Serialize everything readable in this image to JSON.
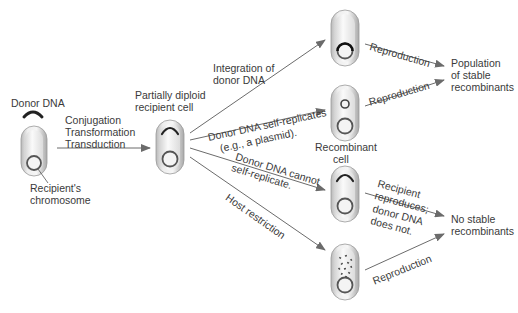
{
  "diagram": {
    "donor": {
      "label": "Donor DNA",
      "chromosome_label_1": "Recipient's",
      "chromosome_label_2": "chromosome"
    },
    "transfer": {
      "line1": "Conjugation",
      "line2": "Transformation",
      "line3": "Transduction"
    },
    "partial_diploid": {
      "line1": "Partially diploid",
      "line2": "recipient cell"
    },
    "paths": [
      {
        "label_1": "Integration of",
        "label_2": "donor DNA",
        "outcome_arrow": "Reproduction"
      },
      {
        "label_1": "Donor DNA self-replicates",
        "label_2": "(e.g., a plasmid).",
        "outcome_arrow": "Reproduction"
      },
      {
        "label_1": "Donor DNA cannot",
        "label_2": "self-replicate.",
        "outcome_arrow_1": "Recipient",
        "outcome_arrow_2": "reproduces;",
        "outcome_arrow_3": "donor DNA",
        "outcome_arrow_4": "does not."
      },
      {
        "label_1": "Host restriction",
        "outcome_arrow": "Reproduction"
      }
    ],
    "recombinant_cell": {
      "line1": "Recombinant",
      "line2": "cell"
    },
    "outcomes": {
      "stable": {
        "line1": "Population",
        "line2": "of stable",
        "line3": "recombinants"
      },
      "unstable": {
        "line1": "No stable",
        "line2": "recombinants"
      }
    },
    "colors": {
      "arrow": "#6b6b6b",
      "cell_fill": "#e8e8e8",
      "cell_border": "#9a9a9a",
      "dna": "#2a2a2a"
    }
  }
}
